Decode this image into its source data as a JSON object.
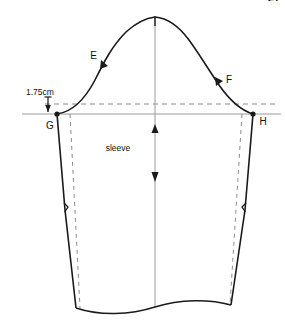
{
  "figure": {
    "name": "sleeve-pattern-draft",
    "title": "sleeve",
    "page_number": "27",
    "labels": {
      "point_e": "E",
      "point_f": "F",
      "point_g": "G",
      "point_h": "H",
      "piece_name": "sleeve",
      "measurement": "1.75cm"
    },
    "colors": {
      "outline": "#1a1a1a",
      "construction": "#888888",
      "guide_dashed": "#8a8a8a",
      "background": "#ffffff",
      "text": "#111111"
    },
    "annotations": {
      "grainline_arrow_up": "arrow-up",
      "grainline_arrow_down": "arrow-down",
      "measurement_arrow": "arrow-down-small",
      "cap_apex_notch": "notch",
      "side_notch_left": "notch",
      "side_notch_right": "notch"
    },
    "geometry": {
      "point_e_xy": [
        104,
        63
      ],
      "point_f_xy": [
        221,
        79
      ],
      "point_g_xy": [
        57,
        114
      ],
      "point_h_xy": [
        253,
        114
      ],
      "cap_apex_xy": [
        155,
        18
      ],
      "bicep_line_y": 114,
      "dashed_guide_y": 104,
      "hem_left_xy": [
        76,
        308
      ],
      "hem_right_xy": [
        231,
        305
      ]
    }
  }
}
